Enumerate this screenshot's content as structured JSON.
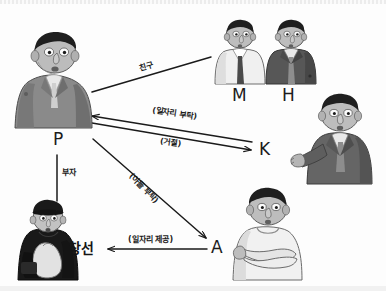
{
  "diagram": {
    "type": "character-relationship-diagram",
    "language": "ko",
    "nodes": [
      {
        "id": "P",
        "label": "P",
        "role": "father",
        "x": 60,
        "y": 138,
        "figure": "man-gray-suit-slouching"
      },
      {
        "id": "M",
        "label": "M",
        "role": "friend",
        "x": 238,
        "y": 96,
        "figure": "man-white-shirt-dark-tie"
      },
      {
        "id": "H",
        "label": "H",
        "role": "friend",
        "x": 286,
        "y": 96,
        "figure": "man-dark-jacket"
      },
      {
        "id": "K",
        "label": "K",
        "role": "acquaintance",
        "x": 262,
        "y": 150,
        "figure": "man-dark-suit-open-hand"
      },
      {
        "id": "A",
        "label": "A",
        "role": "employer",
        "x": 215,
        "y": 248,
        "figure": "man-white-sweater-arms-crossed"
      },
      {
        "id": "CS",
        "label": "창선",
        "role": "son",
        "x": 75,
        "y": 250,
        "figure": "young-man-black-coat-beret"
      }
    ],
    "edges": [
      {
        "id": "p-friends",
        "from": "P",
        "to": "MH",
        "label": "친구",
        "style": "plain-line",
        "direction": "none"
      },
      {
        "id": "k-to-p",
        "from": "K",
        "to": "P",
        "label": "(일자리 부탁)",
        "style": "arrow",
        "direction": "left"
      },
      {
        "id": "p-to-k",
        "from": "P",
        "to": "K",
        "label": "(거절)",
        "style": "arrow",
        "direction": "right"
      },
      {
        "id": "p-to-cs",
        "from": "P",
        "to": "창선",
        "label": "부자",
        "style": "plain-line",
        "direction": "none"
      },
      {
        "id": "p-to-a",
        "from": "P",
        "to": "A",
        "label": "(아들 부탁)",
        "style": "arrow",
        "direction": "down-right"
      },
      {
        "id": "a-to-cs",
        "from": "A",
        "to": "창선",
        "label": "(일자리 제공)",
        "style": "arrow",
        "direction": "left"
      }
    ]
  },
  "labels": {
    "p": "P",
    "m": "M",
    "h": "H",
    "k": "K",
    "a": "A",
    "changseon": "창선",
    "friend": "친구",
    "job_request": "(일자리 부탁)",
    "refusal": "(거절)",
    "father_son": "부자",
    "son_request": "(아들 부탁)",
    "job_offer": "(일자리 제공)"
  },
  "colors": {
    "ink": "#1a1a1a",
    "paper": "#fdfdfd",
    "suit_mid_gray": "#7e7e7e",
    "suit_dark_gray": "#5a5a5a",
    "shirt_light": "#ededed",
    "skin": "#b9b9b9",
    "hair_black": "#1e1e1e",
    "coat_black": "#191919"
  }
}
